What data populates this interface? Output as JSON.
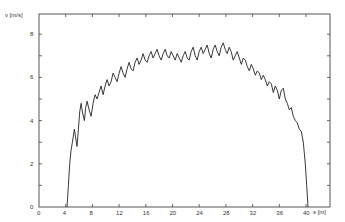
{
  "chart_data": {
    "type": "line",
    "title": "",
    "xlabel": "s [m]",
    "ylabel": "v [m/s]",
    "xlim": [
      0,
      43.6
    ],
    "ylim": [
      0,
      8.9
    ],
    "x_ticks": [
      0,
      4,
      8,
      12,
      16,
      20,
      24,
      28,
      32,
      36,
      40
    ],
    "y_ticks": [
      0,
      2,
      4,
      6,
      8
    ],
    "y_minor_ticks": [
      1,
      3,
      5,
      7
    ],
    "grid": false,
    "legend": null,
    "series": [
      {
        "name": "velocity",
        "color": "#222222",
        "points": [
          [
            4.2,
            0.0
          ],
          [
            4.4,
            1.0
          ],
          [
            4.6,
            2.0
          ],
          [
            4.8,
            2.6
          ],
          [
            5.0,
            3.0
          ],
          [
            5.3,
            3.6
          ],
          [
            5.5,
            3.2
          ],
          [
            5.7,
            2.8
          ],
          [
            5.9,
            3.6
          ],
          [
            6.1,
            4.4
          ],
          [
            6.3,
            4.8
          ],
          [
            6.5,
            4.4
          ],
          [
            6.8,
            4.0
          ],
          [
            7.0,
            4.6
          ],
          [
            7.2,
            4.9
          ],
          [
            7.5,
            4.5
          ],
          [
            7.8,
            4.2
          ],
          [
            8.1,
            4.8
          ],
          [
            8.4,
            5.2
          ],
          [
            8.7,
            5.0
          ],
          [
            9.0,
            5.3
          ],
          [
            9.3,
            5.6
          ],
          [
            9.6,
            5.2
          ],
          [
            9.9,
            5.6
          ],
          [
            10.2,
            5.9
          ],
          [
            10.5,
            5.6
          ],
          [
            10.8,
            5.8
          ],
          [
            11.1,
            6.2
          ],
          [
            11.4,
            6.0
          ],
          [
            11.7,
            5.8
          ],
          [
            12.0,
            6.2
          ],
          [
            12.3,
            6.5
          ],
          [
            12.6,
            6.2
          ],
          [
            12.9,
            6.0
          ],
          [
            13.2,
            6.4
          ],
          [
            13.5,
            6.7
          ],
          [
            13.8,
            6.4
          ],
          [
            14.1,
            6.3
          ],
          [
            14.4,
            6.7
          ],
          [
            14.7,
            6.9
          ],
          [
            15.0,
            6.6
          ],
          [
            15.3,
            6.8
          ],
          [
            15.6,
            7.1
          ],
          [
            15.9,
            6.8
          ],
          [
            16.2,
            6.7
          ],
          [
            16.5,
            7.0
          ],
          [
            16.8,
            7.2
          ],
          [
            17.1,
            6.9
          ],
          [
            17.4,
            7.1
          ],
          [
            17.7,
            7.3
          ],
          [
            18.0,
            7.0
          ],
          [
            18.3,
            6.8
          ],
          [
            18.6,
            7.1
          ],
          [
            18.9,
            7.3
          ],
          [
            19.2,
            7.0
          ],
          [
            19.5,
            6.9
          ],
          [
            19.8,
            7.2
          ],
          [
            20.1,
            7.0
          ],
          [
            20.4,
            6.8
          ],
          [
            20.7,
            7.1
          ],
          [
            21.0,
            6.9
          ],
          [
            21.3,
            6.7
          ],
          [
            21.6,
            7.0
          ],
          [
            21.9,
            7.2
          ],
          [
            22.2,
            6.9
          ],
          [
            22.5,
            6.8
          ],
          [
            22.8,
            7.2
          ],
          [
            23.1,
            7.4
          ],
          [
            23.4,
            7.0
          ],
          [
            23.7,
            6.8
          ],
          [
            24.0,
            7.2
          ],
          [
            24.3,
            7.4
          ],
          [
            24.6,
            7.1
          ],
          [
            24.9,
            7.3
          ],
          [
            25.2,
            7.5
          ],
          [
            25.5,
            7.1
          ],
          [
            25.8,
            6.9
          ],
          [
            26.1,
            7.3
          ],
          [
            26.4,
            7.5
          ],
          [
            26.7,
            7.2
          ],
          [
            27.0,
            7.0
          ],
          [
            27.3,
            7.4
          ],
          [
            27.6,
            7.6
          ],
          [
            27.9,
            7.3
          ],
          [
            28.2,
            7.1
          ],
          [
            28.5,
            7.4
          ],
          [
            28.8,
            7.2
          ],
          [
            29.1,
            6.8
          ],
          [
            29.4,
            7.0
          ],
          [
            29.7,
            7.2
          ],
          [
            30.0,
            6.9
          ],
          [
            30.3,
            6.6
          ],
          [
            30.6,
            6.9
          ],
          [
            30.9,
            6.8
          ],
          [
            31.2,
            6.5
          ],
          [
            31.5,
            6.3
          ],
          [
            31.8,
            6.6
          ],
          [
            32.1,
            6.4
          ],
          [
            32.4,
            6.1
          ],
          [
            32.7,
            6.3
          ],
          [
            33.0,
            6.2
          ],
          [
            33.3,
            5.9
          ],
          [
            33.6,
            6.1
          ],
          [
            33.9,
            5.9
          ],
          [
            34.2,
            5.6
          ],
          [
            34.5,
            5.8
          ],
          [
            34.8,
            5.7
          ],
          [
            35.1,
            5.3
          ],
          [
            35.4,
            5.6
          ],
          [
            35.7,
            5.4
          ],
          [
            36.0,
            5.0
          ],
          [
            36.3,
            5.4
          ],
          [
            36.6,
            5.5
          ],
          [
            36.9,
            5.0
          ],
          [
            37.2,
            4.8
          ],
          [
            37.5,
            4.5
          ],
          [
            37.8,
            4.6
          ],
          [
            38.1,
            4.2
          ],
          [
            38.4,
            4.0
          ],
          [
            38.7,
            3.9
          ],
          [
            39.0,
            3.6
          ],
          [
            39.3,
            3.5
          ],
          [
            39.6,
            3.0
          ],
          [
            39.9,
            2.0
          ],
          [
            40.1,
            1.0
          ],
          [
            40.3,
            0.0
          ]
        ]
      }
    ],
    "frame": {
      "left_px": 39,
      "right_px": 330,
      "top_px": 14,
      "bottom_px": 207
    }
  }
}
